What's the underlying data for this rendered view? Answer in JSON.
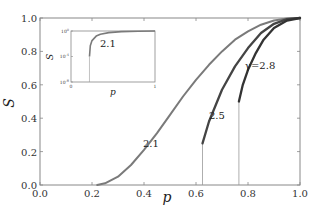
{
  "chart_data": {
    "type": "line",
    "title": "",
    "xlabel": "p",
    "ylabel": "S",
    "xlim": [
      0.0,
      1.0
    ],
    "ylim": [
      0.0,
      1.0
    ],
    "xticks": [
      "0.0",
      "0.2",
      "0.4",
      "0.6",
      "0.8",
      "1.0"
    ],
    "yticks": [
      "0.0",
      "0.2",
      "0.4",
      "0.6",
      "0.8",
      "1.0"
    ],
    "grid": false,
    "legend": "none (inline curve labels)",
    "series": [
      {
        "name": "2.1",
        "label_text": "2.1",
        "color": "#7a7a7a",
        "x": [
          0.22,
          0.25,
          0.3,
          0.35,
          0.4,
          0.45,
          0.5,
          0.55,
          0.6,
          0.65,
          0.7,
          0.75,
          0.8,
          0.85,
          0.9,
          0.95,
          1.0
        ],
        "y": [
          0.0,
          0.01,
          0.05,
          0.12,
          0.21,
          0.31,
          0.42,
          0.53,
          0.63,
          0.72,
          0.8,
          0.87,
          0.92,
          0.96,
          0.985,
          0.997,
          1.0
        ]
      },
      {
        "name": "2.5",
        "label_text": "2.5",
        "color": "#444444",
        "transition_p": 0.625,
        "x": [
          0.625,
          0.65,
          0.7,
          0.75,
          0.8,
          0.85,
          0.9,
          0.95,
          1.0
        ],
        "y": [
          0.25,
          0.38,
          0.57,
          0.71,
          0.82,
          0.91,
          0.965,
          0.993,
          1.0
        ]
      },
      {
        "name": "2.8",
        "label_text": "γ=2.8",
        "color": "#333333",
        "transition_p": 0.765,
        "x": [
          0.765,
          0.78,
          0.8,
          0.83,
          0.86,
          0.9,
          0.95,
          1.0
        ],
        "y": [
          0.5,
          0.6,
          0.69,
          0.79,
          0.87,
          0.94,
          0.985,
          1.0
        ]
      }
    ],
    "inset": {
      "xlabel": "p",
      "ylabel": "S",
      "xlim": [
        0,
        1
      ],
      "xticks": [
        "0",
        "1"
      ],
      "yscale": "log",
      "yticks": [
        "10^0",
        "10^-4",
        "10^-8"
      ],
      "series": [
        {
          "name": "2.1",
          "label_text": "2.1",
          "color": "#7a7a7a",
          "x": [
            0.22,
            0.22,
            0.23,
            0.25,
            0.3,
            0.35,
            0.45,
            0.6,
            0.8,
            1.0
          ],
          "y_log10": [
            -8,
            -4,
            -2.3,
            -1.5,
            -0.8,
            -0.5,
            -0.25,
            -0.1,
            -0.03,
            0
          ]
        }
      ]
    }
  }
}
